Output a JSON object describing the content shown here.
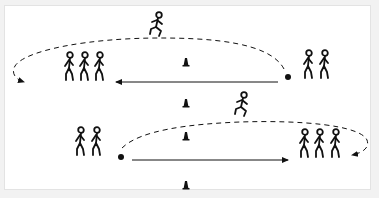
{
  "diagram": {
    "type": "sports-drill",
    "colors": {
      "ink": "#111111",
      "field": "#ffffff",
      "border": "#e3e3e3",
      "background": "#f2f2f2"
    },
    "top_half": {
      "left_group_count": 3,
      "right_group_count": 2,
      "runner": "jumping runner over top dashed path",
      "solid_arrow_direction": "right-to-left",
      "dashed_arrow_direction": "right-to-left looping down to left group"
    },
    "bottom_half": {
      "left_group_count": 2,
      "right_group_count": 3,
      "runner": "running figure over bottom dashed path",
      "solid_arrow_direction": "left-to-right",
      "dashed_arrow_direction": "left-to-right looping down to right group"
    },
    "cones": {
      "count": 4,
      "position": "center column"
    },
    "balls": {
      "count": 2
    }
  }
}
